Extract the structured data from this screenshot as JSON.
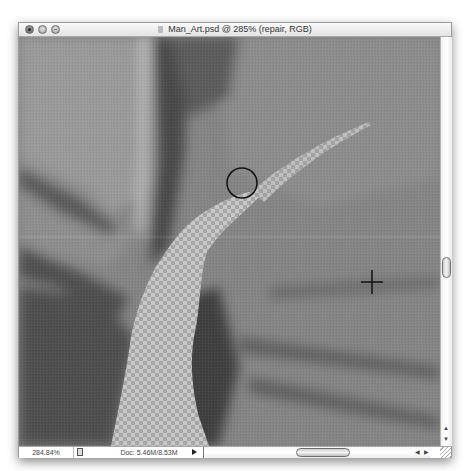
{
  "window": {
    "title": "Man_Art.psd @ 285% (repair, RGB)",
    "controls": [
      "close",
      "minimize",
      "zoom"
    ]
  },
  "canvas": {
    "description": "Zoomed grayscale photo detail with a transparent (checkerboard) repaired stroke",
    "brush_cursor": "circle-brush-cursor",
    "crosshair_cursor": "crosshair-icon",
    "transparency_pattern": "checkerboard"
  },
  "statusbar": {
    "zoom_level": "284.84%",
    "doc_info": "Doc: 5.46M/8.53M"
  },
  "scrollbars": {
    "vertical_up_arrow": "▲",
    "vertical_down_arrow": "▼",
    "horizontal_left_arrow": "◀",
    "horizontal_right_arrow": "▶"
  },
  "colors": {
    "chrome_bg": "#e9e9e9",
    "canvas_mid_gray": "#7a7a7a",
    "checker_light": "#c8c8c8",
    "checker_dark": "#a6a6a6"
  }
}
